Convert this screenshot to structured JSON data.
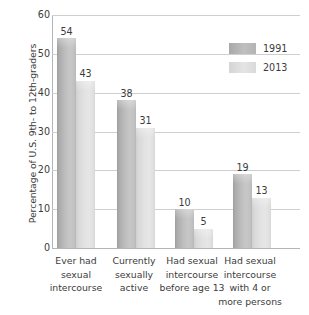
{
  "chart_data": {
    "type": "bar",
    "title": "",
    "xlabel": "",
    "ylabel": "Percentage of U.S. 9th- to 12th-graders",
    "ylim": [
      0,
      60
    ],
    "yticks": [
      60,
      50,
      40,
      30,
      20,
      10,
      0
    ],
    "grid": true,
    "legend_position": "top-right",
    "categories": [
      "Ever had sexual intercourse",
      "Currently sexually active",
      "Had sexual intercourse before age 13",
      "Had sexual intercourse with 4 or more persons"
    ],
    "category_lines": [
      [
        "Ever had",
        "sexual",
        "intercourse"
      ],
      [
        "Currently",
        "sexually",
        "active"
      ],
      [
        "Had sexual",
        "intercourse",
        "before age 13"
      ],
      [
        "Had sexual",
        "intercourse",
        "with 4 or",
        "more persons"
      ]
    ],
    "series": [
      {
        "name": "1991",
        "color": "#b9b9b9",
        "values": [
          54,
          38,
          10,
          19
        ]
      },
      {
        "name": "2013",
        "color": "#e0e0e0",
        "values": [
          43,
          31,
          5,
          13
        ]
      }
    ]
  },
  "legend": {
    "items": [
      {
        "label": "1991"
      },
      {
        "label": "2013"
      }
    ]
  }
}
